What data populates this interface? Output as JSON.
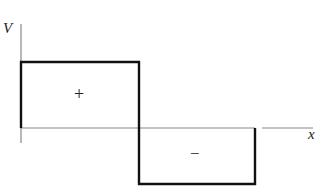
{
  "diagram": {
    "type": "square-wave-voltage-plot",
    "y_axis_label": "V",
    "x_axis_label": "x",
    "positive_region_label": "+",
    "negative_region_label": "−",
    "colors": {
      "stroke": "#111111",
      "axis": "#777777",
      "background": "#ffffff"
    }
  }
}
